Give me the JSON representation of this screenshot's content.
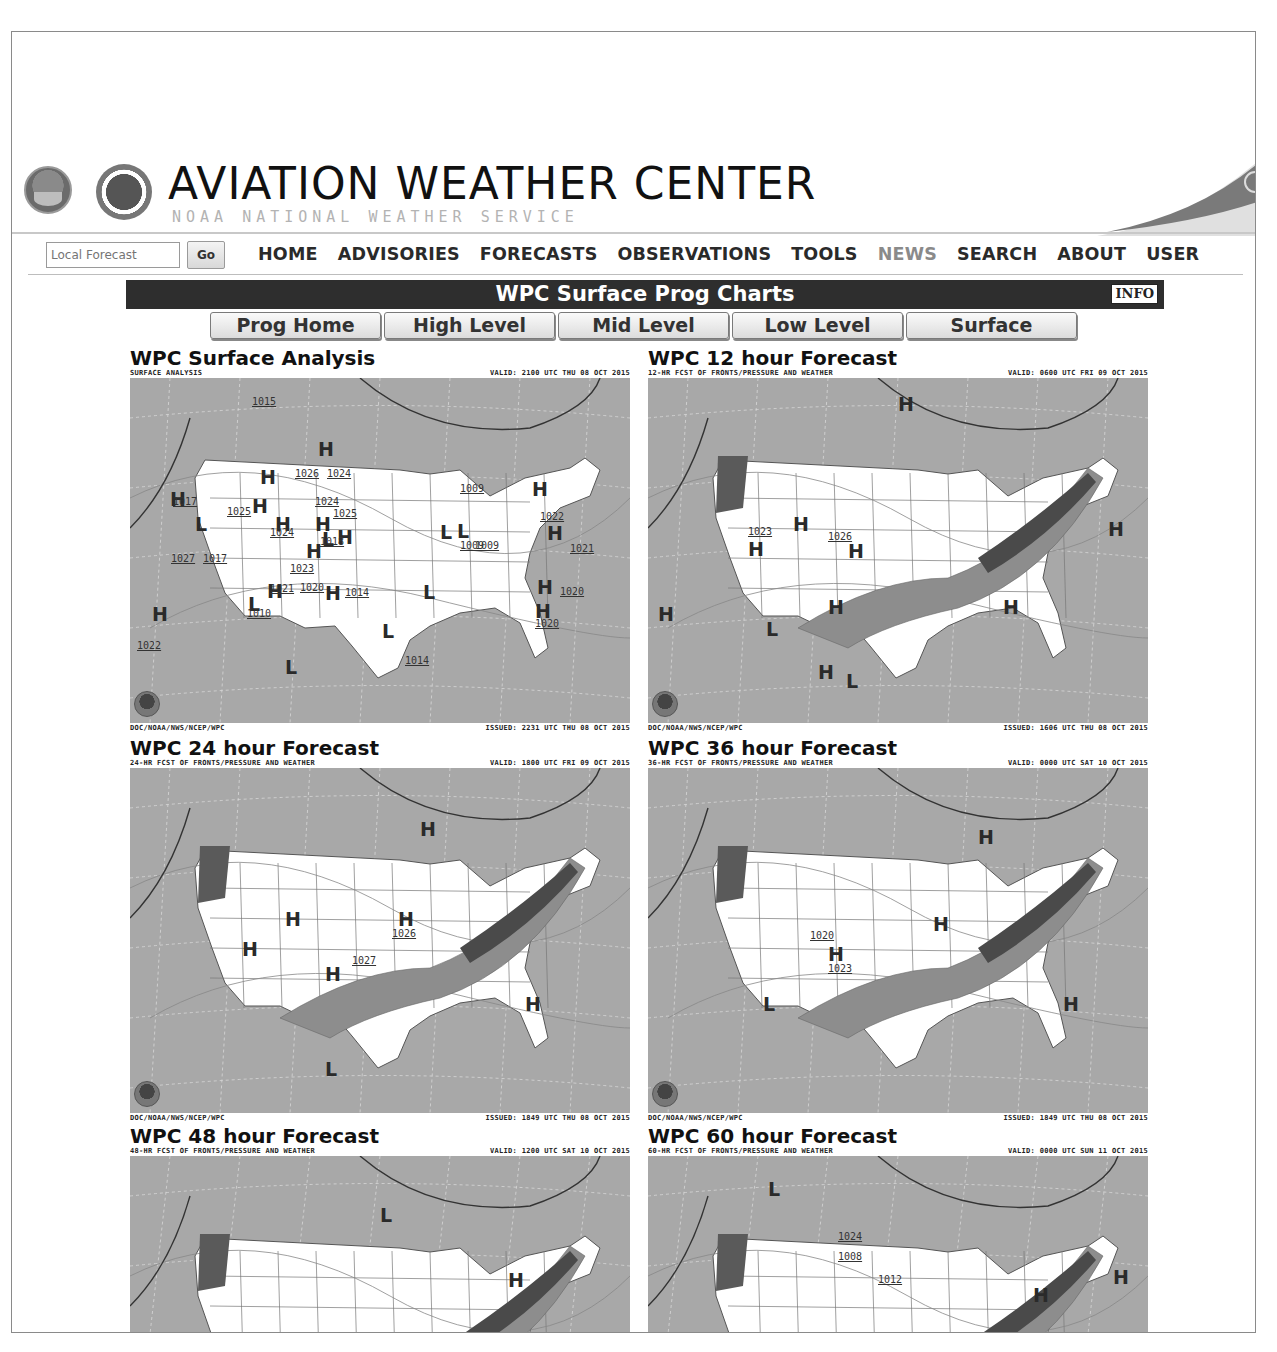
{
  "header": {
    "title": "AVIATION WEATHER CENTER",
    "subtitle": "NOAA   NATIONAL WEATHER SERVICE",
    "logos": [
      "noaa-logo",
      "nws-logo"
    ]
  },
  "search": {
    "placeholder": "Local Forecast",
    "value": "",
    "go_label": "Go"
  },
  "nav": {
    "items": [
      {
        "label": "HOME",
        "dim": false
      },
      {
        "label": "ADVISORIES",
        "dim": false
      },
      {
        "label": "FORECASTS",
        "dim": false
      },
      {
        "label": "OBSERVATIONS",
        "dim": false
      },
      {
        "label": "TOOLS",
        "dim": false
      },
      {
        "label": "NEWS",
        "dim": true
      },
      {
        "label": "SEARCH",
        "dim": false
      },
      {
        "label": "ABOUT",
        "dim": false
      },
      {
        "label": "USER",
        "dim": false
      }
    ]
  },
  "page": {
    "title": "WPC Surface Prog Charts",
    "info_label": "INFO",
    "tabs": [
      "Prog Home",
      "High Level",
      "Mid Level",
      "Low Level",
      "Surface"
    ]
  },
  "charts": [
    {
      "title": "WPC Surface Analysis",
      "product": "SURFACE ANALYSIS",
      "valid": "VALID: 2100 UTC THU 08 OCT 2015",
      "credit": "DOC/NOAA/NWS/NCEP/WPC",
      "issued": "ISSUED: 2231 UTC THU 08 OCT 2015",
      "highs": [
        [
          188,
          60
        ],
        [
          130,
          88
        ],
        [
          122,
          117
        ],
        [
          145,
          135
        ],
        [
          185,
          135
        ],
        [
          207,
          148
        ],
        [
          176,
          162
        ],
        [
          40,
          110
        ],
        [
          22,
          225
        ],
        [
          137,
          202
        ],
        [
          195,
          204
        ],
        [
          402,
          100
        ],
        [
          417,
          144
        ],
        [
          407,
          198
        ],
        [
          405,
          222
        ]
      ],
      "lows": [
        [
          65,
          135
        ],
        [
          252,
          242
        ],
        [
          293,
          203
        ],
        [
          310,
          143
        ],
        [
          327,
          142
        ],
        [
          192,
          150
        ],
        [
          118,
          215
        ],
        [
          155,
          278
        ]
      ],
      "isobars": [
        [
          122,
          18,
          "1015"
        ],
        [
          165,
          90,
          "1026"
        ],
        [
          197,
          90,
          "1024"
        ],
        [
          185,
          118,
          "1024"
        ],
        [
          203,
          130,
          "1025"
        ],
        [
          97,
          128,
          "1025"
        ],
        [
          43,
          118,
          "1017"
        ],
        [
          140,
          149,
          "1024"
        ],
        [
          190,
          158,
          "1018"
        ],
        [
          41,
          175,
          "1027"
        ],
        [
          73,
          175,
          "1017"
        ],
        [
          160,
          185,
          "1023"
        ],
        [
          140,
          205,
          "1021"
        ],
        [
          170,
          204,
          "1020"
        ],
        [
          215,
          209,
          "1014"
        ],
        [
          117,
          230,
          "1010"
        ],
        [
          330,
          105,
          "1009"
        ],
        [
          330,
          162,
          "1009"
        ],
        [
          345,
          162,
          "1009"
        ],
        [
          410,
          133,
          "1022"
        ],
        [
          440,
          165,
          "1021"
        ],
        [
          430,
          208,
          "1020"
        ],
        [
          405,
          240,
          "1020"
        ],
        [
          275,
          277,
          "1014"
        ],
        [
          7,
          262,
          "1022"
        ]
      ],
      "shaded": false
    },
    {
      "title": "WPC 12 hour Forecast",
      "product": "12-HR FCST OF FRONTS/PRESSURE AND WEATHER",
      "valid": "VALID: 0600 UTC FRI 09 OCT 2015",
      "credit": "DOC/NOAA/NWS/NCEP/WPC",
      "issued": "ISSUED: 1606 UTC THU 08 OCT 2015",
      "highs": [
        [
          250,
          15
        ],
        [
          145,
          135
        ],
        [
          100,
          160
        ],
        [
          200,
          162
        ],
        [
          180,
          218
        ],
        [
          355,
          218
        ],
        [
          460,
          140
        ],
        [
          10,
          225
        ],
        [
          170,
          283
        ]
      ],
      "lows": [
        [
          198,
          292
        ],
        [
          118,
          240
        ]
      ],
      "isobars": [
        [
          180,
          153,
          "1026"
        ],
        [
          100,
          148,
          "1023"
        ]
      ],
      "shaded": true
    },
    {
      "title": "WPC 24 hour Forecast",
      "product": "24-HR FCST OF FRONTS/PRESSURE AND WEATHER",
      "valid": "VALID: 1800 UTC FRI 09 OCT 2015",
      "credit": "DOC/NOAA/NWS/NCEP/WPC",
      "issued": "ISSUED: 1849 UTC THU 08 OCT 2015",
      "highs": [
        [
          290,
          50
        ],
        [
          155,
          140
        ],
        [
          268,
          140
        ],
        [
          112,
          170
        ],
        [
          195,
          195
        ],
        [
          395,
          225
        ]
      ],
      "lows": [
        [
          195,
          290
        ]
      ],
      "isobars": [
        [
          262,
          160,
          "1026"
        ],
        [
          222,
          187,
          "1027"
        ]
      ],
      "shaded": true
    },
    {
      "title": "WPC 36 hour Forecast",
      "product": "36-HR FCST OF FRONTS/PRESSURE AND WEATHER",
      "valid": "VALID: 0000 UTC SAT 10 OCT 2015",
      "credit": "DOC/NOAA/NWS/NCEP/WPC",
      "issued": "ISSUED: 1849 UTC THU 08 OCT 2015",
      "highs": [
        [
          330,
          58
        ],
        [
          285,
          145
        ],
        [
          180,
          175
        ],
        [
          415,
          225
        ]
      ],
      "lows": [
        [
          115,
          225
        ]
      ],
      "isobars": [
        [
          180,
          195,
          "1023"
        ],
        [
          162,
          162,
          "1020"
        ]
      ],
      "shaded": true
    },
    {
      "title": "WPC 48 hour Forecast",
      "product": "48-HR FCST OF FRONTS/PRESSURE AND WEATHER",
      "valid": "VALID: 1200 UTC SAT 10 OCT 2015",
      "credit": "",
      "issued": "",
      "highs": [
        [
          378,
          113
        ]
      ],
      "lows": [
        [
          250,
          48
        ]
      ],
      "isobars": [],
      "shaded": true
    },
    {
      "title": "WPC 60 hour Forecast",
      "product": "60-HR FCST OF FRONTS/PRESSURE AND WEATHER",
      "valid": "VALID: 0000 UTC SUN 11 OCT 2015",
      "credit": "",
      "issued": "",
      "highs": [
        [
          385,
          128
        ],
        [
          465,
          110
        ]
      ],
      "lows": [
        [
          120,
          22
        ]
      ],
      "isobars": [
        [
          190,
          75,
          "1024"
        ],
        [
          190,
          95,
          "1008"
        ],
        [
          230,
          118,
          "1012"
        ]
      ],
      "shaded": true
    }
  ]
}
